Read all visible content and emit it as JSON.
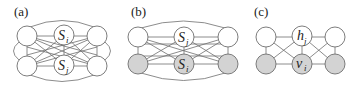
{
  "panels": [
    {
      "label": "(a)",
      "nodes": [
        {
          "id": "tl",
          "shaded": false,
          "label": ""
        },
        {
          "id": "tm",
          "shaded": false,
          "label": "S",
          "sub": "i"
        },
        {
          "id": "tr",
          "shaded": false,
          "label": ""
        },
        {
          "id": "bl",
          "shaded": false,
          "label": ""
        },
        {
          "id": "bm",
          "shaded": false,
          "label": "S",
          "sub": "j"
        },
        {
          "id": "br",
          "shaded": false,
          "label": ""
        }
      ],
      "description": "fully connected graph of 6 unshaded nodes"
    },
    {
      "label": "(b)",
      "nodes": [
        {
          "id": "tl",
          "shaded": false,
          "label": ""
        },
        {
          "id": "tm",
          "shaded": false,
          "label": "S",
          "sub": "j"
        },
        {
          "id": "tr",
          "shaded": false,
          "label": ""
        },
        {
          "id": "bl",
          "shaded": true,
          "label": ""
        },
        {
          "id": "bm",
          "shaded": true,
          "label": "S",
          "sub": "i"
        },
        {
          "id": "br",
          "shaded": true,
          "label": ""
        }
      ],
      "description": "fully connected graph, top row unshaded, bottom row shaded"
    },
    {
      "label": "(c)",
      "nodes": [
        {
          "id": "tl",
          "shaded": false,
          "label": ""
        },
        {
          "id": "tm",
          "shaded": false,
          "label": "h",
          "sub": "j"
        },
        {
          "id": "tr",
          "shaded": false,
          "label": ""
        },
        {
          "id": "bl",
          "shaded": true,
          "label": ""
        },
        {
          "id": "bm",
          "shaded": true,
          "label": "v",
          "sub": "i"
        },
        {
          "id": "br",
          "shaded": true,
          "label": ""
        }
      ],
      "description": "locally connected grid graph, hidden top row, visible shaded bottom row"
    }
  ],
  "colors": {
    "edge": "#6e6e6e",
    "shaded_fill": "#d3d3d3",
    "unshaded_fill": "#ffffff"
  }
}
